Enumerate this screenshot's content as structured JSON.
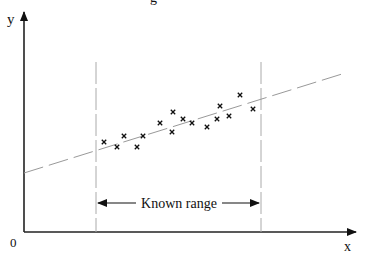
{
  "title_partial": "g",
  "axes": {
    "y_label": "y",
    "x_label": "x",
    "origin_label": "0"
  },
  "annotation": {
    "range_label": "Known range"
  },
  "chart_data": {
    "type": "scatter",
    "title": "",
    "xlabel": "x",
    "ylabel": "y",
    "grid": false,
    "legend": "none",
    "points_px": [
      [
        104,
        142
      ],
      [
        117,
        147
      ],
      [
        124,
        136
      ],
      [
        137,
        147
      ],
      [
        143,
        136
      ],
      [
        160,
        123
      ],
      [
        172,
        132
      ],
      [
        173,
        112
      ],
      [
        183,
        119
      ],
      [
        192,
        123
      ],
      [
        207,
        127
      ],
      [
        217,
        119
      ],
      [
        220,
        106
      ],
      [
        229,
        116
      ],
      [
        240,
        95
      ],
      [
        253,
        109
      ]
    ],
    "fit_line_px": {
      "x1": 24,
      "y1": 173,
      "x2": 342,
      "y2": 74
    },
    "known_range_px": {
      "x_min": 96,
      "x_max": 261
    }
  }
}
